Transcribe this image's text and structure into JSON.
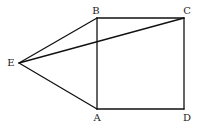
{
  "figure": {
    "type": "geometry",
    "points": {
      "A": {
        "label": "A",
        "x": 97,
        "y": 109,
        "lx": 97,
        "ly": 121
      },
      "B": {
        "label": "B",
        "x": 97,
        "y": 18,
        "lx": 96,
        "ly": 14
      },
      "C": {
        "label": "C",
        "x": 184,
        "y": 18,
        "lx": 187,
        "ly": 14
      },
      "D": {
        "label": "D",
        "x": 184,
        "y": 109,
        "lx": 187,
        "ly": 121
      },
      "E": {
        "label": "E",
        "x": 19,
        "y": 63,
        "lx": 11,
        "ly": 66
      }
    },
    "segments": [
      [
        "A",
        "B"
      ],
      [
        "B",
        "C"
      ],
      [
        "C",
        "D"
      ],
      [
        "D",
        "A"
      ],
      [
        "E",
        "B"
      ],
      [
        "E",
        "A"
      ],
      [
        "E",
        "C"
      ]
    ],
    "stroke_color": "#111111"
  }
}
